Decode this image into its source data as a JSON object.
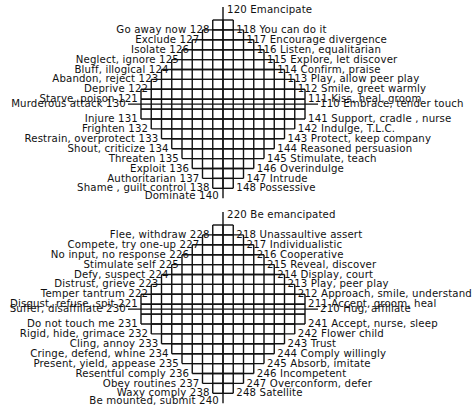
{
  "upper_diagram": {
    "top_label": "120 Emancipate",
    "bottom_label": "Dominate 140",
    "left_labels": [
      "Go away now 128",
      "Exclude 127",
      "Isolate 126",
      "Neglect, ignore 125",
      "Bluff, illogical 124",
      "Abandon, reject 123",
      "Deprive 122",
      "Starve, poison 121",
      "Murderous attack 130",
      "Injure 131",
      "Frighten 132",
      "Restrain, overprotect 133",
      "Shout, criticize 134",
      "Threaten 135",
      "Exploit 136",
      "Authoritarian 137",
      "Shame , guilt control 138"
    ],
    "right_labels": [
      "118 You can do it",
      "117 Encourage divergence",
      "116 Listen, equalitarian",
      "115 Explore, let discover",
      "114 Confirm, praise",
      "113 Play, allow peer play",
      "112 Smile, greet warmly",
      "111 Kiss, heal, groom",
      "110 Embrace, tender touch",
      "141 Support, cradle , nurse",
      "142 Indulge, T.L.C.",
      "143 Protect, keep company",
      "144 Reasoned persuasion",
      "145 Stimulate, teach",
      "146 Overindulge",
      "147 Intrude",
      "148 Possessive"
    ]
  },
  "lower_diagram": {
    "top_label": "220 Be emancipated",
    "bottom_label": "Be mounted, submit 240",
    "left_labels": [
      "Flee, withdraw 228",
      "Compete, try one-up 227",
      "No input, no response 226",
      "Stimulate self 225",
      "Defy, suspect 224",
      "Distrust, grieve 223",
      "Temper tantrum 222",
      "Disgust, refuse, spit 221",
      "Suffer, disaffiliate 230",
      "Do not touch me 231",
      "Rigid, hide, grimace 232",
      "Cling, annoy 233",
      "Cringe, defend, whine 234",
      "Present, yield, appease 235",
      "Resentful comply 236",
      "Obey routines 237",
      "Waxy comply 238"
    ],
    "right_labels": [
      "218 Unassaultive assert",
      "217 Individualistic",
      "216 Cooperative",
      "215 Reveal, discover",
      "214 Display, court",
      "213 Play, peer play",
      "212 Approach, smile, understand",
      "211 Accept, groom, heal",
      "210 Hug, affiliate",
      "241 Accept, nurse, sleep",
      "242 Flower child",
      "243 Trust",
      "244 Comply willingly",
      "245 Absorb, imitate",
      "246 Incompetent",
      "247 Overconform, defer",
      "248 Satellite"
    ]
  },
  "colors": {
    "line": "#111111",
    "background": "#ffffff"
  }
}
